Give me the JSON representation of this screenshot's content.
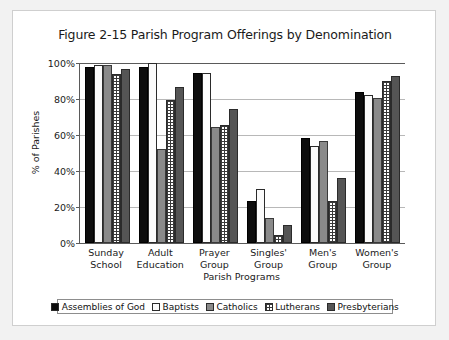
{
  "chart_data": {
    "type": "bar",
    "title": "Figure 2-15 Parish Program Offerings by Denomination",
    "xlabel": "Parish Programs",
    "ylabel": "% of Parishes",
    "ylim": [
      0,
      100
    ],
    "yticks": [
      "0%",
      "20%",
      "40%",
      "60%",
      "80%",
      "100%"
    ],
    "ytick_values": [
      0,
      20,
      40,
      60,
      80,
      100
    ],
    "grid": true,
    "legend_position": "bottom",
    "categories": [
      "Sunday School",
      "Adult Education",
      "Prayer Group",
      "Singles' Group",
      "Men's Group",
      "Women's Group"
    ],
    "category_lines": [
      [
        "Sunday",
        "School"
      ],
      [
        "Adult",
        "Education"
      ],
      [
        "Prayer",
        "Group"
      ],
      [
        "Singles'",
        "Group"
      ],
      [
        "Men's",
        "Group"
      ],
      [
        "Women's",
        "Group"
      ]
    ],
    "series": [
      {
        "name": "Assemblies of God",
        "fill": "solid-black",
        "color": "#0d0d0d",
        "values": [
          98,
          98,
          94.5,
          23.5,
          58.5,
          84
        ]
      },
      {
        "name": "Baptists",
        "fill": "white-stipple",
        "color": "#fbfbfb",
        "values": [
          99,
          100,
          94.5,
          30,
          54,
          82.5
        ]
      },
      {
        "name": "Catholics",
        "fill": "solid-gray",
        "color": "#8a8a8a",
        "values": [
          99,
          52.5,
          64.5,
          14,
          56.5,
          80.5
        ]
      },
      {
        "name": "Lutherans",
        "fill": "grid-crosshatch",
        "color": "#ffffff",
        "values": [
          94,
          79.5,
          65.5,
          4.5,
          23.5,
          90
        ]
      },
      {
        "name": "Presbyterians",
        "fill": "solid-dark-gray",
        "color": "#555555",
        "values": [
          96.5,
          86.5,
          74.5,
          10,
          36,
          93
        ]
      }
    ]
  }
}
